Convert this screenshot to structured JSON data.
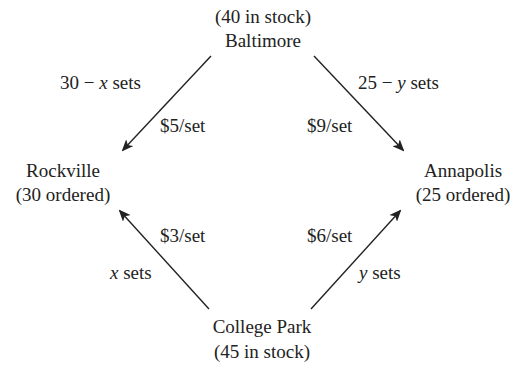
{
  "nodes": {
    "baltimore": {
      "name": "Baltimore",
      "info": "(40 in stock)"
    },
    "rockville": {
      "name": "Rockville",
      "info": "(30 ordered)"
    },
    "annapolis": {
      "name": "Annapolis",
      "info": "(25 ordered)"
    },
    "college_park": {
      "name": "College Park",
      "info": "(45 in stock)"
    }
  },
  "edges": {
    "baltimore_rockville": {
      "qty_prefix": "30 − ",
      "qty_var": "x",
      "qty_suffix": " sets",
      "cost": "$5/set"
    },
    "baltimore_annapolis": {
      "qty_prefix": "25 − ",
      "qty_var": "y",
      "qty_suffix": " sets",
      "cost": "$9/set"
    },
    "collegepark_rockville": {
      "qty_var": "x",
      "qty_suffix": " sets",
      "cost": "$3/set"
    },
    "collegepark_annapolis": {
      "qty_var": "y",
      "qty_suffix": " sets",
      "cost": "$6/set"
    }
  }
}
